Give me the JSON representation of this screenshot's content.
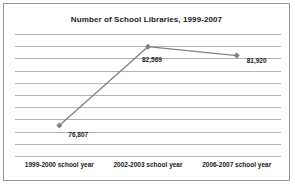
{
  "chart_data": {
    "type": "line",
    "title": "Number of School Libraries, 1999-2007",
    "xlabel": "",
    "ylabel": "",
    "categories": [
      "1999-2000 school year",
      "2002-2003 school year",
      "2006-2007 school year"
    ],
    "values": [
      76807,
      82569,
      81920
    ],
    "value_labels": [
      "76,807",
      "82,569",
      "81,920"
    ],
    "ylim": [
      74500,
      83500
    ],
    "grid": true,
    "gridline_count": 11,
    "legend": "none",
    "marker": "diamond",
    "series_color": "#808080",
    "gridline_color": "#b3b3b3",
    "text_color": "#1a1a1a",
    "border_color": "#9a9a9a",
    "background_color": "#ffffff"
  }
}
